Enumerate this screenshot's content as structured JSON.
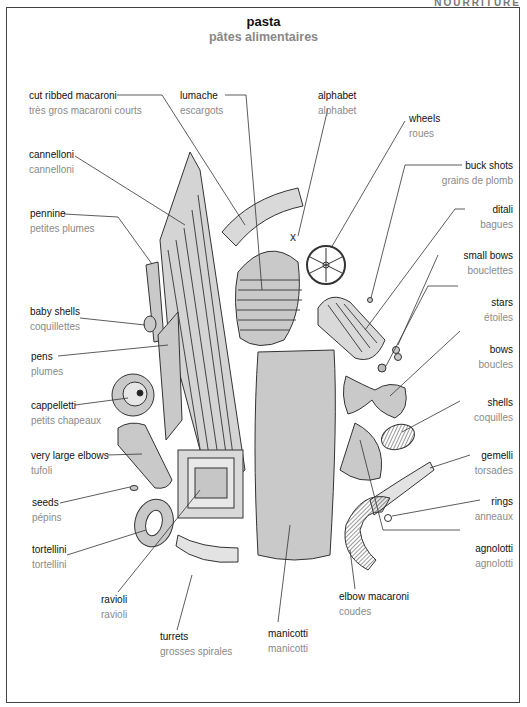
{
  "header": {
    "corner_text": "NOURRITURE",
    "title": "pasta",
    "subtitle": "pâtes alimentaires"
  },
  "labels": {
    "cut_ribbed_macaroni": {
      "en": "cut ribbed macaroni",
      "fr": "très gros macaroni courts"
    },
    "lumache": {
      "en": "lumache",
      "fr": "escargots"
    },
    "alphabet": {
      "en": "alphabet",
      "fr": "alphabet"
    },
    "wheels": {
      "en": "wheels",
      "fr": "roues"
    },
    "buck_shots": {
      "en": "buck shots",
      "fr": "grains de plomb"
    },
    "ditali": {
      "en": "ditali",
      "fr": "bagues"
    },
    "small_bows": {
      "en": "small bows",
      "fr": "bouclettes"
    },
    "stars": {
      "en": "stars",
      "fr": "étoiles"
    },
    "bows": {
      "en": "bows",
      "fr": "boucles"
    },
    "shells": {
      "en": "shells",
      "fr": "coquilles"
    },
    "gemelli": {
      "en": "gemelli",
      "fr": "torsades"
    },
    "rings": {
      "en": "rings",
      "fr": "anneaux"
    },
    "agnolotti": {
      "en": "agnolotti",
      "fr": "agnolotti"
    },
    "elbow_macaroni": {
      "en": "elbow macaroni",
      "fr": "coudes"
    },
    "manicotti": {
      "en": "manicotti",
      "fr": "manicotti"
    },
    "turrets": {
      "en": "turrets",
      "fr": "grosses spirales"
    },
    "ravioli": {
      "en": "ravioli",
      "fr": "ravioli"
    },
    "tortellini": {
      "en": "tortellini",
      "fr": "tortellini"
    },
    "seeds": {
      "en": "seeds",
      "fr": "pépins"
    },
    "very_large_elbows": {
      "en": "very large elbows",
      "fr": "tufoli"
    },
    "cappelletti": {
      "en": "cappelletti",
      "fr": "petits chapeaux"
    },
    "pens": {
      "en": "pens",
      "fr": "plumes"
    },
    "baby_shells": {
      "en": "baby shells",
      "fr": "coquillettes"
    },
    "pennine": {
      "en": "pennine",
      "fr": "petites plumes"
    },
    "cannelloni": {
      "en": "cannelloni",
      "fr": "cannelloni"
    }
  },
  "colors": {
    "pasta_fill": "#c9c9c9",
    "pasta_light": "#e6e6e6",
    "outline": "#333333",
    "english_text": "#111111",
    "french_text": "#8a8a8a"
  }
}
